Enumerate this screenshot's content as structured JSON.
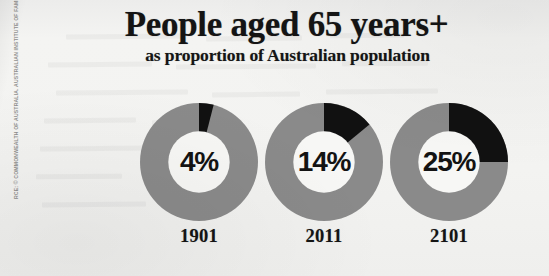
{
  "source_credit": "RCE: © COMMONWEALTH OF AUSTRALIA. AUSTRALIAN INSTITUTE OF FAMILY STUDIES",
  "header": {
    "title": "People aged 65 years+",
    "subtitle": "as proportion of Australian population"
  },
  "colors": {
    "background": "#f1f1ef",
    "highlight": "#111111",
    "remainder": "#8a8a8a",
    "hole": "#f7f7f5",
    "text": "#141414"
  },
  "chart_data": {
    "type": "pie",
    "title": "People aged 65 years+",
    "subtitle": "as proportion of Australian population",
    "xlabel": "",
    "ylabel": "",
    "legend": "none",
    "grid": false,
    "units": "percent",
    "donut_hole_ratio": 0.52,
    "start_angle_deg": 0,
    "categories": [
      "1901",
      "2011",
      "2101"
    ],
    "series": [
      {
        "name": "Aged 65 years+",
        "values": [
          4,
          14,
          25
        ],
        "color": "#111111"
      },
      {
        "name": "Rest of population",
        "values": [
          96,
          86,
          75
        ],
        "color": "#8a8a8a"
      }
    ],
    "donuts": [
      {
        "year": "1901",
        "value": 4,
        "label": "4%"
      },
      {
        "year": "2011",
        "value": 14,
        "label": "14%"
      },
      {
        "year": "2101",
        "value": 25,
        "label": "25%"
      }
    ]
  }
}
